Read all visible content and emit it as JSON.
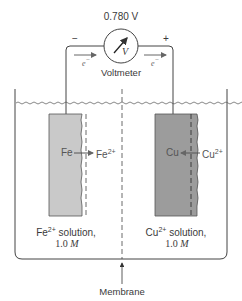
{
  "voltmeter": {
    "reading": "0.780 V",
    "label": "Voltmeter",
    "symbol": "V",
    "negative_terminal": "−",
    "positive_terminal": "+"
  },
  "electron_flow": {
    "left_label": "e",
    "right_label": "e",
    "charge": "−"
  },
  "left_cell": {
    "electrode": "Fe",
    "ion": "Fe",
    "ion_charge": "2+",
    "solution_ion": "Fe",
    "solution_charge": "2+",
    "solution_text": " solution,",
    "concentration_value": "1.0",
    "concentration_unit": "M",
    "electrode_color": "#c9c9c9"
  },
  "right_cell": {
    "electrode": "Cu",
    "ion": "Cu",
    "ion_charge": "2+",
    "solution_ion": "Cu",
    "solution_charge": "2+",
    "solution_text": " solution,",
    "concentration_value": "1.0",
    "concentration_unit": "M",
    "electrode_color": "#9c9c9c"
  },
  "membrane": {
    "label": "Membrane"
  },
  "colors": {
    "line": "#444444",
    "arrow": "#666666"
  }
}
